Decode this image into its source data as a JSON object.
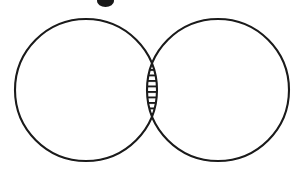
{
  "figure": {
    "type": "venn-diagram",
    "caption": "",
    "width": 294,
    "height": 181,
    "background_color": "#ffffff",
    "stroke_color": "#1a1a1a",
    "fill_color": "#ffffff",
    "hatch_color": "#1a1a1a"
  },
  "chart_data": {
    "type": "diagram",
    "diagram_type": "venn-2-set",
    "title": "",
    "sets": [
      {
        "id": "left-set",
        "label": "",
        "center_x": 86,
        "center_y": 90,
        "radius": 71,
        "shaded": false
      },
      {
        "id": "right-set",
        "label": "",
        "center_x": 218,
        "center_y": 90,
        "radius": 71,
        "shaded": false
      }
    ],
    "regions": [
      {
        "id": "left-only",
        "label": "",
        "shaded": false,
        "fill": "none"
      },
      {
        "id": "intersection",
        "label": "",
        "shaded": true,
        "fill": "horizontal-hatch",
        "hatch_line_count": 23,
        "hatch_spacing_px": 5.5,
        "hatch_orientation": "horizontal"
      },
      {
        "id": "right-only",
        "label": "",
        "shaded": false,
        "fill": "none"
      }
    ],
    "intersection_bounds": {
      "top_x": 152,
      "top_y": 30,
      "bottom_x": 152,
      "bottom_y": 160,
      "left_x": 103,
      "right_x": 198
    },
    "annotations": [
      {
        "id": "clipped-glyph",
        "description": "partially cropped dark mark at top edge",
        "x": 97,
        "y": 1,
        "width": 17,
        "height": 6
      }
    ],
    "grid": false,
    "legend": "none",
    "axis_labels": [],
    "tick_labels": []
  }
}
